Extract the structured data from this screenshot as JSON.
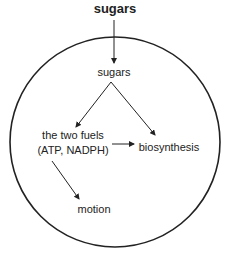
{
  "diagram": {
    "external_input": "sugars",
    "cell_nodes": {
      "sugars": "sugars",
      "fuels_line1": "the two fuels",
      "fuels_line2": "(ATP, NADPH)",
      "biosynthesis": "biosynthesis",
      "motion": "motion"
    },
    "edges": [
      {
        "from": "sugars (outside)",
        "to": "sugars"
      },
      {
        "from": "sugars",
        "to": "the two fuels (ATP, NADPH)"
      },
      {
        "from": "sugars",
        "to": "biosynthesis"
      },
      {
        "from": "the two fuels (ATP, NADPH)",
        "to": "biosynthesis"
      },
      {
        "from": "the two fuels (ATP, NADPH)",
        "to": "motion"
      }
    ],
    "colors": {
      "stroke": "#222222",
      "background": "#ffffff"
    }
  }
}
